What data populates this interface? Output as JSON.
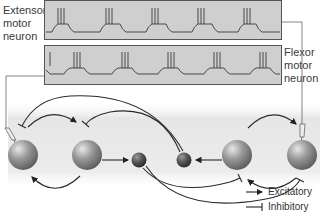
{
  "labels": {
    "extensor": "Extensor motor neuron",
    "extensor_lines": [
      "Extensor",
      "motor",
      "neuron"
    ],
    "flexor": "Flexor motor neuron",
    "flexor_lines": [
      "Flexor",
      "motor",
      "neuron"
    ]
  },
  "legend": {
    "excitatory": "Excitatory",
    "inhibitory": "Inhibitory"
  },
  "colors": {
    "trace_bg": "#cfcfcf",
    "trace_line": "#3a3a3a",
    "neuron": "#8a8a8a",
    "connection": "#333333"
  },
  "neurons": [
    {
      "id": "left-motor",
      "type": "large",
      "recorded": true
    },
    {
      "id": "left-inter",
      "type": "large"
    },
    {
      "id": "left-inhib",
      "type": "small"
    },
    {
      "id": "right-inhib",
      "type": "small"
    },
    {
      "id": "right-inter",
      "type": "large"
    },
    {
      "id": "right-motor",
      "type": "large",
      "recorded": true
    }
  ],
  "traces": {
    "extensor_bursts": 4,
    "flexor_bursts": 4,
    "spikes_per_burst": 3
  }
}
